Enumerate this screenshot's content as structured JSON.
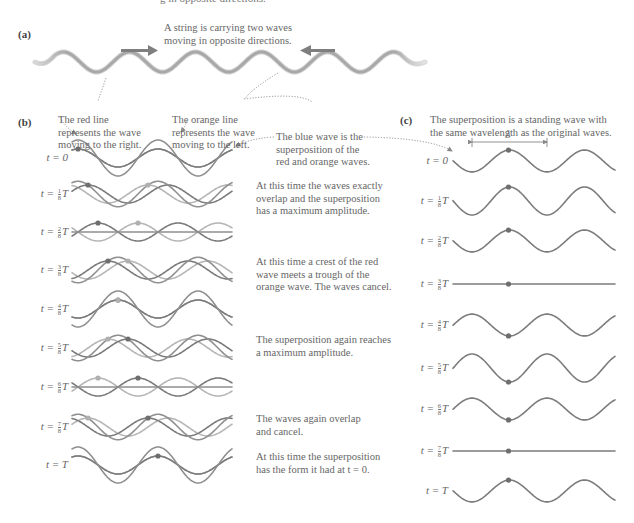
{
  "clipped_header": "g in opposite directions.",
  "panel_a": {
    "label": "(a)",
    "caption_lines": [
      "A string is carrying two waves",
      "moving in opposite directions."
    ],
    "arrow_right": "arrow-right",
    "arrow_left": "arrow-left"
  },
  "panel_b": {
    "label": "(b)",
    "red_note": [
      "The red line",
      "represents the wave",
      "moving to the right."
    ],
    "orange_note": [
      "The orange line",
      "represents the wave",
      "moving to the left."
    ],
    "blue_note": [
      "The blue wave is the",
      "superposition of the",
      "red and orange waves."
    ],
    "rows": [
      {
        "t": "t = 0",
        "num": "",
        "den": "",
        "suffix": "",
        "y": 158,
        "note": []
      },
      {
        "t": "t = ",
        "num": "1",
        "den": "8",
        "suffix": "T",
        "y": 194,
        "note": [
          "At this time the waves exactly",
          "overlap and the superposition",
          "has a maximum amplitude."
        ]
      },
      {
        "t": "t = ",
        "num": "2",
        "den": "8",
        "suffix": "T",
        "y": 232,
        "note": []
      },
      {
        "t": "t = ",
        "num": "3",
        "den": "8",
        "suffix": "T",
        "y": 270,
        "note": [
          "At this time a crest of the red",
          "wave meets a trough of the",
          "orange wave. The waves cancel."
        ]
      },
      {
        "t": "t = ",
        "num": "4",
        "den": "8",
        "suffix": "T",
        "y": 309,
        "note": []
      },
      {
        "t": "t = ",
        "num": "5",
        "den": "8",
        "suffix": "T",
        "y": 348,
        "note": [
          "The superposition again reaches",
          "a maximum amplitude."
        ]
      },
      {
        "t": "t = ",
        "num": "6",
        "den": "8",
        "suffix": "T",
        "y": 387,
        "note": []
      },
      {
        "t": "t = ",
        "num": "7",
        "den": "8",
        "suffix": "T",
        "y": 427,
        "note": [
          "The waves again overlap",
          "and cancel."
        ]
      },
      {
        "t": "t = T",
        "num": "",
        "den": "",
        "suffix": "",
        "y": 465,
        "note": [
          "At this time the superposition",
          "has the form it had at t = 0."
        ]
      }
    ]
  },
  "panel_c": {
    "label": "(c)",
    "caption_lines": [
      "The superposition is a standing wave with",
      "the same wavelength as the original waves."
    ],
    "lambda_label": "λ",
    "rows": [
      {
        "t": "t = 0",
        "num": "",
        "den": "",
        "suffix": "",
        "y": 161
      },
      {
        "t": "t = ",
        "num": "1",
        "den": "8",
        "suffix": "T",
        "y": 201
      },
      {
        "t": "t = ",
        "num": "2",
        "den": "8",
        "suffix": "T",
        "y": 241
      },
      {
        "t": "t = ",
        "num": "3",
        "den": "8",
        "suffix": "T",
        "y": 284
      },
      {
        "t": "t = ",
        "num": "4",
        "den": "8",
        "suffix": "T",
        "y": 325
      },
      {
        "t": "t = ",
        "num": "5",
        "den": "8",
        "suffix": "T",
        "y": 368
      },
      {
        "t": "t = ",
        "num": "6",
        "den": "8",
        "suffix": "T",
        "y": 409
      },
      {
        "t": "t = ",
        "num": "7",
        "den": "8",
        "suffix": "T",
        "y": 451
      },
      {
        "t": "t = T",
        "num": "",
        "den": "",
        "suffix": "",
        "y": 491
      }
    ]
  },
  "colors": {
    "red_wave": "#7a7a7a",
    "orange_wave": "#b5b5b5",
    "blue_wave": "#8f8f8f",
    "standing_wave": "#7c7c7c",
    "string": "#a8a8a8",
    "arrow": "#7f7f7f",
    "dot_dark": "#6e6e6e",
    "dot_light": "#b0b0b0",
    "leader": "#888888"
  }
}
